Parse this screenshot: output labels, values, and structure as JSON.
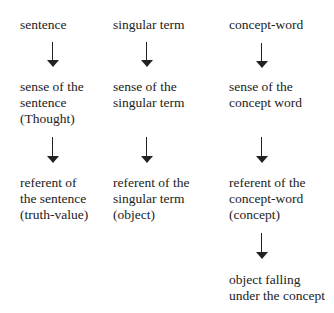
{
  "diagram": {
    "columns": [
      {
        "name": "sentence-column",
        "nodes": [
          {
            "lines": [
              "sentence"
            ]
          },
          {
            "lines": [
              "sense of the",
              "sentence",
              "(Thought)"
            ]
          },
          {
            "lines": [
              "referent of",
              "the sentence",
              "(truth-value)"
            ]
          }
        ]
      },
      {
        "name": "singular-term-column",
        "nodes": [
          {
            "lines": [
              "singular term"
            ]
          },
          {
            "lines": [
              "sense of the",
              "singular term"
            ]
          },
          {
            "lines": [
              "referent of the",
              "singular term",
              "(object)"
            ]
          }
        ]
      },
      {
        "name": "concept-word-column",
        "nodes": [
          {
            "lines": [
              "concept-word"
            ]
          },
          {
            "lines": [
              "sense of the",
              "concept word"
            ]
          },
          {
            "lines": [
              "referent of the",
              "concept-word",
              "(concept)"
            ]
          },
          {
            "lines": [
              "object falling",
              "under the concept"
            ]
          }
        ]
      }
    ],
    "edges": [
      {
        "from": "sentence",
        "to": "sense of the sentence (Thought)"
      },
      {
        "from": "sense of the sentence (Thought)",
        "to": "referent of the sentence (truth-value)"
      },
      {
        "from": "singular term",
        "to": "sense of the singular term"
      },
      {
        "from": "sense of the singular term",
        "to": "referent of the singular term (object)"
      },
      {
        "from": "concept-word",
        "to": "sense of the concept word"
      },
      {
        "from": "sense of the concept word",
        "to": "referent of the concept-word (concept)"
      },
      {
        "from": "referent of the concept-word (concept)",
        "to": "object falling under the concept"
      }
    ]
  }
}
